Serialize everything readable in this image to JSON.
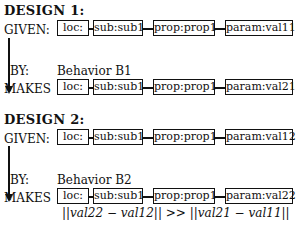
{
  "designs": [
    {
      "title": "DESIGN 1:",
      "given_label": "GIVEN:",
      "by_label": "BY:",
      "behavior": "Behavior B1",
      "makes_label": "MAKES",
      "given_chain": [
        "loc:",
        "sub:sub1",
        "prop:prop1",
        "param:val11"
      ],
      "makes_chain": [
        "loc:",
        "sub:sub1",
        "prop:prop1",
        "param:val21"
      ]
    },
    {
      "title": "DESIGN 2:",
      "given_label": "GIVEN:",
      "by_label": "BY:",
      "behavior": "Behavior B2",
      "makes_label": "MAKES",
      "given_chain": [
        "loc:",
        "sub:sub1",
        "prop:prop1",
        "param:val12"
      ],
      "makes_chain": [
        "loc:",
        "sub:sub1",
        "prop:prop1",
        "param:val22"
      ]
    }
  ],
  "formula": "||val22 − val12|| >> ||val21 − val11||"
}
